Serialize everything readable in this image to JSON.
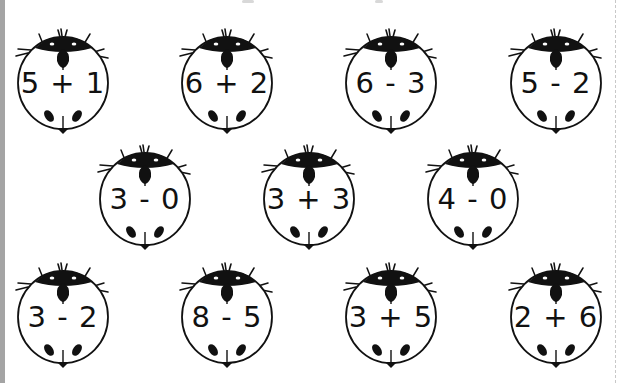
{
  "worksheet": {
    "title": "",
    "rows": [
      {
        "ladybugs": [
          {
            "problem": "5 + 1",
            "x": 8,
            "y": 22
          },
          {
            "problem": "6 + 2",
            "x": 172,
            "y": 22
          },
          {
            "problem": "6 - 3",
            "x": 336,
            "y": 22
          },
          {
            "problem": "5 - 2",
            "x": 501,
            "y": 22
          }
        ]
      },
      {
        "ladybugs": [
          {
            "problem": "3 - 0",
            "x": 90,
            "y": 138
          },
          {
            "problem": "3 + 3",
            "x": 254,
            "y": 138
          },
          {
            "problem": "4 - 0",
            "x": 418,
            "y": 138
          }
        ]
      },
      {
        "ladybugs": [
          {
            "problem": "3 - 2",
            "x": 8,
            "y": 256
          },
          {
            "problem": "8 - 5",
            "x": 172,
            "y": 256
          },
          {
            "problem": "3 + 5",
            "x": 336,
            "y": 256
          },
          {
            "problem": "2 + 6",
            "x": 501,
            "y": 256
          }
        ]
      }
    ]
  },
  "colors": {
    "ink": "#111111",
    "paper": "#ffffff",
    "left_strip": "#a4a4a4",
    "dash": "#c8c8c8"
  },
  "icons": {
    "ladybug": "ladybug-icon"
  }
}
